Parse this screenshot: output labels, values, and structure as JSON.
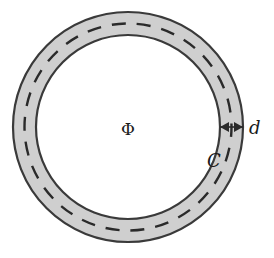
{
  "diagram": {
    "type": "toroid-cross-section",
    "labels": {
      "flux": "Φ",
      "thickness": "d",
      "contour": "C"
    },
    "geometry": {
      "center": [
        128,
        127
      ],
      "outer_radius": 115,
      "inner_radius": 92,
      "contour_radius": 103.5
    },
    "colors": {
      "ring_fill": "#cfcfcf",
      "ring_stroke": "#3a3a3a",
      "dash": "#2a2a2a",
      "text": "#1a1a1a",
      "background": "#ffffff"
    }
  }
}
